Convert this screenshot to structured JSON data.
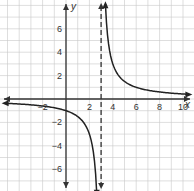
{
  "chart_data": {
    "type": "line",
    "title": "",
    "xlabel": "x",
    "ylabel": "y",
    "function": "y = 3/(x - 3)",
    "xlim": [
      -5.6,
      10.9
    ],
    "ylim": [
      -7.9,
      8.4
    ],
    "grid": true,
    "grid_step": 1,
    "x_ticks": [
      {
        "value": -2,
        "label": "−2"
      },
      {
        "value": 2,
        "label": "2"
      },
      {
        "value": 4,
        "label": "4"
      },
      {
        "value": 6,
        "label": "6"
      },
      {
        "value": 8,
        "label": "8"
      },
      {
        "value": 10,
        "label": "10"
      }
    ],
    "y_ticks": [
      {
        "value": 6,
        "label": "6"
      },
      {
        "value": 4,
        "label": "4"
      },
      {
        "value": 2,
        "label": "2"
      },
      {
        "value": -2,
        "label": "−2"
      },
      {
        "value": -4,
        "label": "−4"
      },
      {
        "value": -6,
        "label": "−6"
      }
    ],
    "asymptotes": [
      {
        "type": "vertical",
        "x": 3,
        "style": "dashed"
      },
      {
        "type": "horizontal",
        "y": 0
      }
    ],
    "series": [
      {
        "name": "right branch",
        "x": [
          3.37,
          3.5,
          4,
          4.5,
          5,
          6,
          7,
          8,
          9,
          10.6
        ],
        "y": [
          8.1,
          6,
          3,
          2,
          1.5,
          1,
          0.75,
          0.6,
          0.5,
          0.39
        ]
      },
      {
        "name": "left branch",
        "x": [
          -5.4,
          -4,
          -2,
          -1,
          0,
          1,
          2,
          2.5,
          2.63
        ],
        "y": [
          -0.36,
          -0.43,
          -0.6,
          -0.75,
          -1,
          -1.5,
          -3,
          -6,
          -8.1
        ]
      }
    ],
    "colors": {
      "grid": "#c8c8c8",
      "axis": "#333333",
      "curve": "#222222"
    }
  }
}
